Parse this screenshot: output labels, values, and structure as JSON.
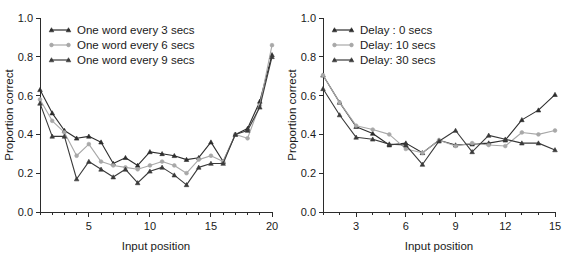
{
  "figure": {
    "background": "#ffffff",
    "panel_count": 2
  },
  "chart_data": [
    {
      "id": "left-panel",
      "type": "line",
      "title": "",
      "xlabel": "Input position",
      "ylabel": "Proportion correct",
      "xlim": [
        1,
        20
      ],
      "ylim": [
        0.0,
        1.0
      ],
      "grid": false,
      "legend_position": "top-left",
      "x": [
        1,
        2,
        3,
        4,
        5,
        6,
        7,
        8,
        9,
        10,
        11,
        12,
        13,
        14,
        15,
        16,
        17,
        18,
        19,
        20
      ],
      "xticks": [
        5,
        10,
        15,
        20
      ],
      "xtick_labels": [
        "5",
        "10",
        "15",
        "20"
      ],
      "xtick_minor": [
        1,
        2,
        3,
        4,
        6,
        7,
        8,
        9,
        11,
        12,
        13,
        14,
        16,
        17,
        18,
        19
      ],
      "yticks": [
        0.0,
        0.2,
        0.4,
        0.6,
        0.8,
        1.0
      ],
      "ytick_labels": [
        "0.0",
        "0.2",
        "0.4",
        "0.6",
        "0.8",
        "1.0"
      ],
      "series": [
        {
          "name": "One word every 3 secs",
          "color": "#2d2d2d",
          "marker": "triangle",
          "values": [
            0.63,
            0.51,
            0.42,
            0.38,
            0.39,
            0.36,
            0.25,
            0.28,
            0.24,
            0.31,
            0.3,
            0.29,
            0.27,
            0.28,
            0.36,
            0.26,
            0.4,
            0.43,
            0.57,
            0.81
          ]
        },
        {
          "name": "One word every 6 secs",
          "color": "#a8a8a8",
          "marker": "circle",
          "values": [
            0.58,
            0.47,
            0.41,
            0.29,
            0.35,
            0.26,
            0.24,
            0.23,
            0.22,
            0.24,
            0.26,
            0.24,
            0.2,
            0.27,
            0.29,
            0.26,
            0.4,
            0.38,
            0.55,
            0.86
          ]
        },
        {
          "name": "One word every 9 secs",
          "color": "#3a3a3a",
          "marker": "triangle",
          "values": [
            0.56,
            0.39,
            0.39,
            0.17,
            0.26,
            0.22,
            0.18,
            0.22,
            0.15,
            0.21,
            0.23,
            0.19,
            0.14,
            0.23,
            0.25,
            0.25,
            0.4,
            0.42,
            0.54,
            0.8
          ]
        }
      ]
    },
    {
      "id": "right-panel",
      "type": "line",
      "title": "",
      "xlabel": "Input position",
      "ylabel": "Proportion correct",
      "xlim": [
        1,
        15
      ],
      "ylim": [
        0.0,
        1.0
      ],
      "grid": false,
      "legend_position": "top-left",
      "x": [
        1,
        2,
        3,
        4,
        5,
        6,
        7,
        8,
        9,
        10,
        11,
        12,
        13,
        14,
        15
      ],
      "xticks": [
        3,
        6,
        9,
        12,
        15
      ],
      "xtick_labels": [
        "3",
        "6",
        "9",
        "12",
        "15"
      ],
      "xtick_minor": [
        1,
        2,
        4,
        5,
        7,
        8,
        10,
        11,
        13,
        14
      ],
      "yticks": [
        0.0,
        0.2,
        0.4,
        0.6,
        0.8,
        1.0
      ],
      "ytick_labels": [
        "0.0",
        "0.2",
        "0.4",
        "0.6",
        "0.8",
        "1.0"
      ],
      "series": [
        {
          "name": "Delay : 0 secs",
          "color": "#2d2d2d",
          "marker": "triangle",
          "values": [
            0.705,
            0.565,
            0.44,
            0.405,
            0.345,
            0.355,
            0.305,
            0.37,
            0.345,
            0.35,
            0.355,
            0.37,
            0.475,
            0.525,
            0.605
          ]
        },
        {
          "name": "Delay:  10 secs",
          "color": "#a8a8a8",
          "marker": "circle",
          "values": [
            0.705,
            0.565,
            0.445,
            0.425,
            0.4,
            0.325,
            0.305,
            0.37,
            0.34,
            0.355,
            0.345,
            0.34,
            0.41,
            0.4,
            0.42
          ]
        },
        {
          "name": "Delay:  30 secs",
          "color": "#3a3a3a",
          "marker": "triangle",
          "values": [
            0.635,
            0.5,
            0.385,
            0.375,
            0.35,
            0.345,
            0.245,
            0.365,
            0.42,
            0.31,
            0.395,
            0.375,
            0.355,
            0.355,
            0.32
          ]
        }
      ]
    }
  ]
}
